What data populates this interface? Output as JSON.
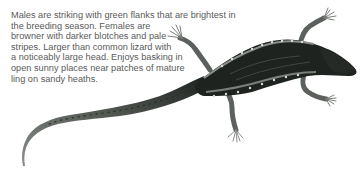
{
  "caption": {
    "lines": [
      "Males are striking with green flanks that are brightest in",
      "the breeding season. Females are",
      "browner with darker blotches and pale",
      "stripes. Larger than common lizard with",
      "a noticeably large head. Enjoys basking in",
      "open sunny places near patches of mature",
      "ling on sandy heaths."
    ]
  },
  "illustration": {
    "subject": "lizard",
    "colors": {
      "body": "#1f2320",
      "flank_stripe": "#8a8f8a",
      "spots": "#d8dcd8",
      "limbs": "#6d716d",
      "tail": "#4a4e4a"
    }
  }
}
